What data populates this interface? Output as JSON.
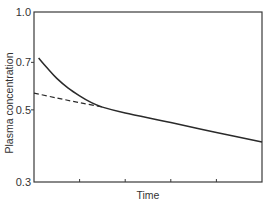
{
  "chart_data": {
    "type": "line",
    "title": "",
    "xlabel": "Time",
    "ylabel": "Plasma concentration",
    "yscale": "log",
    "ylim": [
      0.3,
      1.0
    ],
    "xlim": [
      0,
      5
    ],
    "yticks": [
      {
        "value": 1.0,
        "label": "1.0"
      },
      {
        "value": 0.7,
        "label": "0.7"
      },
      {
        "value": 0.5,
        "label": "0.5"
      },
      {
        "value": 0.3,
        "label": "0.3"
      }
    ],
    "xticks": [
      1,
      2,
      3,
      4
    ],
    "xtick_labels_visible": false,
    "grid": false,
    "legend": null,
    "series": [
      {
        "name": "Observed plasma concentration",
        "style": "solid",
        "color": "#2a2a2a",
        "x": [
          0.1,
          0.3,
          0.5,
          0.75,
          1.0,
          1.25,
          1.5,
          2.0,
          3.0,
          4.0,
          5.0
        ],
        "values": [
          0.722,
          0.67,
          0.625,
          0.583,
          0.552,
          0.527,
          0.51,
          0.489,
          0.457,
          0.426,
          0.398
        ]
      },
      {
        "name": "Back-extrapolated terminal phase",
        "style": "dashed",
        "color": "#2a2a2a",
        "x": [
          0,
          0.5,
          1.0,
          1.5
        ],
        "values": [
          0.563,
          0.544,
          0.526,
          0.51
        ]
      }
    ]
  }
}
